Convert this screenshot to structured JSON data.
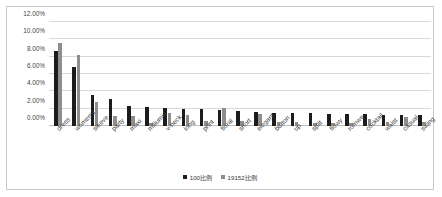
{
  "chart_data": {
    "type": "bar",
    "title": "",
    "subtitle": "",
    "xlabel": "",
    "ylabel": "",
    "ylim": [
      0,
      12
    ],
    "ytick_labels": [
      "0.00%",
      "2.00%",
      "4.00%",
      "6.00%",
      "8.00%",
      "10.00%",
      "12.00%"
    ],
    "ytick_values": [
      0,
      2,
      4,
      6,
      8,
      10,
      12
    ],
    "grid": true,
    "legend_position": "bottom",
    "categories": [
      "dress",
      "women's",
      "sleeve",
      "party",
      "maxi",
      "miliumia",
      "v-neck",
      "long",
      "print",
      "floral",
      "short",
      "elegant",
      "button",
      "up",
      "split",
      "flowy",
      "romwe",
      "cocktail",
      "waist",
      "casual",
      "swing"
    ],
    "series": [
      {
        "name": "100比例",
        "color": "#1c1c1c",
        "values": [
          8.6,
          6.85,
          3.55,
          3.1,
          2.3,
          2.2,
          2.05,
          2.0,
          1.95,
          1.9,
          1.7,
          1.6,
          1.55,
          1.5,
          1.45,
          1.4,
          1.4,
          1.35,
          1.3,
          1.3,
          1.25
        ]
      },
      {
        "name": "19152比例",
        "color": "#8e8e8e",
        "values": [
          9.55,
          8.2,
          2.75,
          1.15,
          1.1,
          0.35,
          1.55,
          1.25,
          0.6,
          2.1,
          0.55,
          1.4,
          0.45,
          0.45,
          0.4,
          0.4,
          0.4,
          0.85,
          0.45,
          1.05,
          0.5
        ]
      }
    ]
  }
}
